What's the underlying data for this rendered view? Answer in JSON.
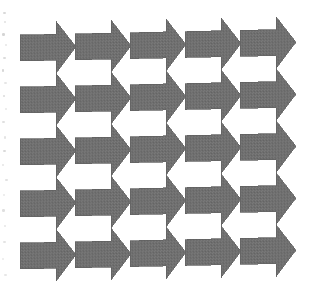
{
  "image": {
    "kind": "geometric-tessellation",
    "title": "Interlocking arrow tessellation",
    "width": 317,
    "height": 293,
    "background_color": "#ffffff",
    "figure_color": "#6b6b6b",
    "figure_edge_color": "#5f5f5f",
    "fill_style": "dithered-halftone-gray",
    "medium": "scanned line art",
    "alt_text": "A five-by-five grid of solid gray right-pointing arrows that interlock so the white space between them forms left-pointing arrows."
  },
  "pattern": {
    "motif": "right-pointing-arrow",
    "negative_motif": "left-pointing-arrow",
    "columns": 5,
    "rows": 5,
    "total_arrows": 25,
    "origin_x": 20,
    "origin_y": 22,
    "step_x": 55,
    "step_y": 52,
    "row_phase_offset_y": 0,
    "skew_deg": -1.2,
    "arrow": {
      "tail_width": 36,
      "body_height": 26,
      "head_length": 20,
      "head_overhang": 13,
      "total_length": 56,
      "total_height": 52
    }
  },
  "geometry": {
    "columns_x": [
      20,
      75,
      130,
      185,
      240
    ],
    "rows_y": [
      22,
      74,
      126,
      178,
      230
    ]
  },
  "artifacts": {
    "label": "scan-speckles",
    "color": "#b9b9b9",
    "marks": [
      {
        "x": 3,
        "y": 12,
        "w": 3,
        "h": 2,
        "o": 0.55
      },
      {
        "x": 4,
        "y": 21,
        "w": 2,
        "h": 2,
        "o": 0.4
      },
      {
        "x": 2,
        "y": 33,
        "w": 3,
        "h": 3,
        "o": 0.62
      },
      {
        "x": 5,
        "y": 44,
        "w": 2,
        "h": 2,
        "o": 0.33
      },
      {
        "x": 3,
        "y": 57,
        "w": 3,
        "h": 2,
        "o": 0.5
      },
      {
        "x": 2,
        "y": 69,
        "w": 2,
        "h": 3,
        "o": 0.58
      },
      {
        "x": 4,
        "y": 82,
        "w": 3,
        "h": 2,
        "o": 0.36
      },
      {
        "x": 3,
        "y": 95,
        "w": 2,
        "h": 2,
        "o": 0.48
      },
      {
        "x": 5,
        "y": 108,
        "w": 2,
        "h": 2,
        "o": 0.3
      },
      {
        "x": 2,
        "y": 121,
        "w": 3,
        "h": 2,
        "o": 0.44
      },
      {
        "x": 4,
        "y": 136,
        "w": 2,
        "h": 3,
        "o": 0.38
      },
      {
        "x": 3,
        "y": 150,
        "w": 3,
        "h": 2,
        "o": 0.52
      },
      {
        "x": 2,
        "y": 164,
        "w": 2,
        "h": 2,
        "o": 0.34
      },
      {
        "x": 5,
        "y": 179,
        "w": 3,
        "h": 2,
        "o": 0.41
      },
      {
        "x": 3,
        "y": 194,
        "w": 2,
        "h": 2,
        "o": 0.29
      },
      {
        "x": 2,
        "y": 209,
        "w": 3,
        "h": 3,
        "o": 0.46
      },
      {
        "x": 4,
        "y": 225,
        "w": 2,
        "h": 2,
        "o": 0.32
      },
      {
        "x": 3,
        "y": 241,
        "w": 3,
        "h": 2,
        "o": 0.39
      },
      {
        "x": 2,
        "y": 258,
        "w": 2,
        "h": 2,
        "o": 0.27
      },
      {
        "x": 4,
        "y": 274,
        "w": 3,
        "h": 2,
        "o": 0.35
      }
    ]
  }
}
